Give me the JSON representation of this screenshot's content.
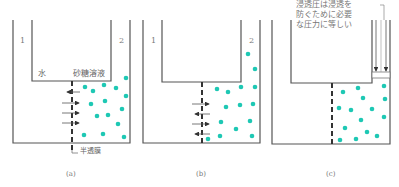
{
  "colors": {
    "solute_dot": "#1ec8b4",
    "line": "#555555",
    "membrane": "#333333",
    "arrow": "#333333"
  },
  "panels": [
    {
      "id": "a",
      "caption": "(a)",
      "side1_label": "1",
      "side2_label": "2",
      "water_label": "水",
      "solution_label": "砂糖溶液",
      "membrane_label": "半透膜",
      "arrows": [
        {
          "direction": "left"
        },
        {
          "direction": "right"
        },
        {
          "direction": "right"
        },
        {
          "direction": "right"
        }
      ]
    },
    {
      "id": "b",
      "caption": "(b)",
      "side1_label": "1",
      "side2_label": "2",
      "arrows": [
        {
          "direction": "right"
        },
        {
          "direction": "left"
        },
        {
          "direction": "right"
        },
        {
          "direction": "left"
        }
      ]
    },
    {
      "id": "c",
      "caption": "(c)",
      "annotation": [
        "浸透圧は浸透を",
        "防ぐために必要",
        "な圧力に等しい"
      ],
      "arrows": [
        {
          "direction": "down"
        },
        {
          "direction": "down"
        }
      ]
    }
  ]
}
